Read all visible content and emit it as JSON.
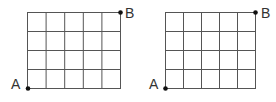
{
  "figure": {
    "colors": {
      "grid_line": "#555555",
      "point": "#111111",
      "label": "#333333",
      "background": "#ffffff"
    },
    "grids": [
      {
        "id": "left",
        "columns": 5,
        "rows": 4,
        "point_a_label": "A",
        "point_b_label": "B"
      },
      {
        "id": "right",
        "columns": 5,
        "rows": 4,
        "point_a_label": "A",
        "point_b_label": "B"
      }
    ]
  }
}
